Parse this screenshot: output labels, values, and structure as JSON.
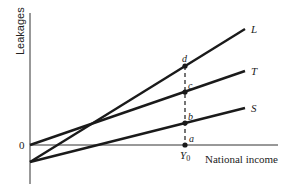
{
  "diagram": {
    "y_axis_label": "Leakages",
    "x_axis_label": "National income",
    "origin_label": "0",
    "equilibrium_label": "Y",
    "equilibrium_subscript": "0",
    "lines": [
      {
        "name": "L",
        "label": "L"
      },
      {
        "name": "T",
        "label": "T"
      },
      {
        "name": "S",
        "label": "S"
      }
    ],
    "points": [
      {
        "name": "d",
        "label": "d"
      },
      {
        "name": "c",
        "label": "c"
      },
      {
        "name": "b",
        "label": "b"
      },
      {
        "name": "a",
        "label": "a"
      }
    ],
    "colors": {
      "line": "#1a1a1a",
      "axis": "#333333",
      "background": "#ffffff"
    }
  }
}
